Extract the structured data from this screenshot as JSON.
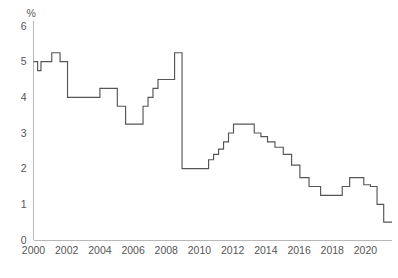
{
  "chart_data": {
    "type": "line",
    "title": "",
    "subtitle": "",
    "xlabel": "",
    "ylabel": "",
    "unit_label": "%",
    "line_style": "step-post",
    "grid": false,
    "legend": false,
    "legend_position": "none",
    "series_color": "#555555",
    "axis_color": "#b8b8b8",
    "label_color": "#555555",
    "background_color": "#ffffff",
    "xlim": [
      2000.0,
      2021.6
    ],
    "ylim": [
      0,
      6
    ],
    "y_ticks": [
      0,
      1,
      2,
      3,
      4,
      5,
      6
    ],
    "y_tick_labels": [
      "0",
      "1",
      "2",
      "3",
      "4",
      "5",
      "6"
    ],
    "x_ticks": [
      2000,
      2002,
      2004,
      2006,
      2008,
      2010,
      2012,
      2014,
      2016,
      2018,
      2020
    ],
    "x_tick_labels": [
      "2000",
      "2002",
      "2004",
      "2006",
      "2008",
      "2010",
      "2012",
      "2014",
      "2016",
      "2018",
      "2020"
    ],
    "x": [
      2000.0,
      2000.25,
      2000.45,
      2000.85,
      2001.1,
      2001.35,
      2001.6,
      2001.8,
      2002.05,
      2002.35,
      2003.0,
      2003.45,
      2004.0,
      2004.35,
      2004.7,
      2005.05,
      2005.55,
      2005.95,
      2006.3,
      2006.6,
      2006.9,
      2007.2,
      2007.5,
      2008.25,
      2008.5,
      2008.7,
      2008.95,
      2009.3,
      2009.6,
      2009.9,
      2010.2,
      2010.55,
      2010.85,
      2011.15,
      2011.45,
      2011.75,
      2012.05,
      2012.4,
      2012.9,
      2013.3,
      2013.7,
      2014.1,
      2014.55,
      2015.05,
      2015.55,
      2016.05,
      2016.6,
      2017.3,
      2018.05,
      2018.6,
      2019.05,
      2019.45,
      2019.9,
      2020.3,
      2020.7,
      2021.1,
      2021.6
    ],
    "values": [
      5.0,
      4.75,
      5.0,
      5.0,
      5.25,
      5.25,
      5.0,
      5.0,
      4.0,
      4.0,
      4.0,
      4.0,
      4.25,
      4.25,
      4.25,
      3.75,
      3.25,
      3.25,
      3.25,
      3.75,
      4.0,
      4.25,
      4.5,
      4.5,
      5.25,
      5.25,
      2.0,
      2.0,
      2.0,
      2.0,
      2.0,
      2.25,
      2.4,
      2.55,
      2.75,
      3.0,
      3.25,
      3.25,
      3.25,
      3.0,
      2.9,
      2.75,
      2.6,
      2.4,
      2.1,
      1.75,
      1.5,
      1.25,
      1.25,
      1.5,
      1.75,
      1.75,
      1.55,
      1.5,
      1.0,
      0.5,
      0.5
    ],
    "annotations": []
  }
}
